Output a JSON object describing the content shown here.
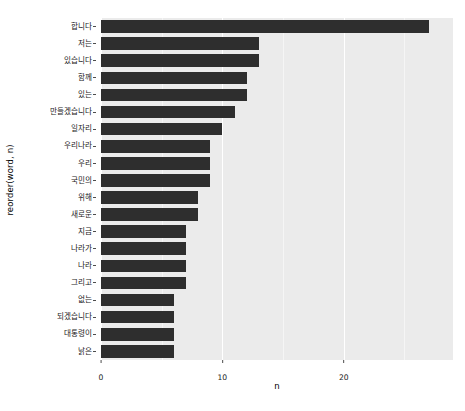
{
  "chart_data": {
    "type": "bar",
    "orientation": "horizontal",
    "title": "",
    "xlabel": "n",
    "ylabel": "reorder(word, n)",
    "xlim": [
      0,
      29
    ],
    "xticks": [
      0,
      10,
      20
    ],
    "xtick_labels": [
      "0",
      "10",
      "20"
    ],
    "grid": true,
    "legend": "none",
    "bar_color": "#2e2e2e",
    "panel_color": "#ebebeb",
    "gridline_color": "#ffffff",
    "categories": [
      "합니다",
      "저는",
      "있습니다",
      "함께",
      "있는",
      "만들겠습니다",
      "일자리",
      "우리나라",
      "우리",
      "국민의",
      "위해",
      "새로운",
      "지금",
      "나라가",
      "나라",
      "그리고",
      "없는",
      "되겠습니다",
      "대통령이",
      "낡은"
    ],
    "values": [
      27,
      13,
      13,
      12,
      12,
      11,
      10,
      9,
      9,
      9,
      8,
      8,
      7,
      7,
      7,
      7,
      6,
      6,
      6,
      6
    ]
  },
  "axis": {
    "y_title": "reorder(word, n)",
    "x_title": "n"
  }
}
